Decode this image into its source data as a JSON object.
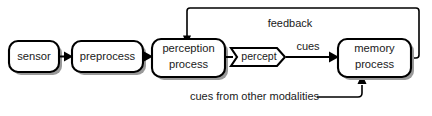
{
  "diagram": {
    "background_color": "#ffffff",
    "stroke_color": "#000000",
    "shadow_color": "#9a9a9a",
    "nodes": [
      {
        "id": "sensor",
        "label": "sensor",
        "shape": "rounded-rect"
      },
      {
        "id": "preprocess",
        "label": "preprocess",
        "shape": "rounded-rect"
      },
      {
        "id": "perception",
        "label_line1": "perception",
        "label_line2": "process",
        "shape": "rounded-rect"
      },
      {
        "id": "percept",
        "label": "percept",
        "shape": "arrow-pentagon"
      },
      {
        "id": "memory",
        "label_line1": "memory",
        "label_line2": "process",
        "shape": "rounded-rect"
      }
    ],
    "edge_labels": {
      "cues": "cues",
      "feedback": "feedback",
      "cues_other": "cues from other modalities"
    }
  }
}
